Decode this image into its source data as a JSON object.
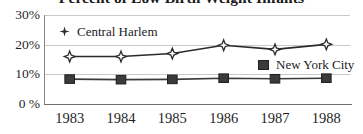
{
  "chart_data": {
    "type": "line",
    "title": "Percent of Low Birth Weight Infants",
    "xlabel": "",
    "ylabel": "",
    "categories": [
      "1983",
      "1984",
      "1985",
      "1986",
      "1987",
      "1988"
    ],
    "x": [
      1983,
      1984,
      1985,
      1986,
      1987,
      1988
    ],
    "series": [
      {
        "name": "Central Harlem",
        "marker": "diamond",
        "color": "#2b2b2b",
        "values": [
          16.0,
          16.0,
          17.0,
          19.8,
          18.4,
          20.1
        ]
      },
      {
        "name": "New York City",
        "marker": "square",
        "color": "#3b3b3b",
        "values": [
          8.4,
          8.2,
          8.3,
          8.7,
          8.5,
          8.7
        ]
      }
    ],
    "ylim": [
      0,
      30
    ],
    "yticks": [
      0,
      10,
      20,
      30
    ],
    "ytick_labels": [
      "0 %",
      "10%",
      "20%",
      "30%"
    ],
    "grid": true,
    "legend_position": "inside"
  },
  "legend": {
    "harlem": {
      "label": "Central Harlem",
      "marker_icon": "diamond-marker-icon"
    },
    "nyc": {
      "label": "New York City",
      "marker_icon": "square-marker-icon"
    }
  },
  "colors": {
    "line": "#2b2b2b",
    "grid": "#c9c9c9",
    "axis": "#6e6e6e",
    "text": "#1f1f1f"
  }
}
